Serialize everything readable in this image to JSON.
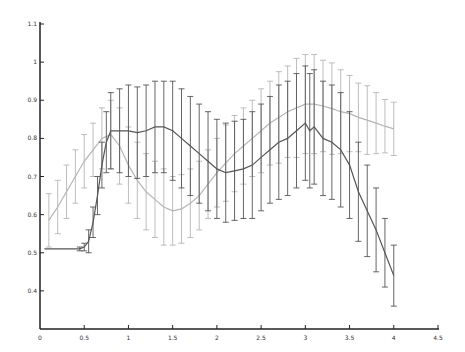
{
  "chart_data": {
    "type": "line",
    "title": "",
    "xlabel": "",
    "ylabel": "",
    "xlim": [
      0,
      4.5
    ],
    "ylim": [
      0.3,
      1.1
    ],
    "x_ticks": [
      0,
      0.5,
      1,
      1.5,
      2,
      2.5,
      3,
      3.5,
      4,
      4.5
    ],
    "x_tick_labels": [
      "0",
      "0.5",
      "1",
      "1.5",
      "2",
      "2.5",
      "3",
      "3.5",
      "4",
      "4.5"
    ],
    "y_ticks": [
      0.4,
      0.5,
      0.6,
      0.7,
      0.8,
      0.9,
      1.0,
      1.1
    ],
    "y_tick_labels": [
      "0.4",
      "0.5",
      "0.6",
      "0.7",
      "0.8",
      "0.9",
      "1",
      "1.1"
    ],
    "grid": false,
    "legend": null,
    "error_bars": true,
    "series": [
      {
        "name": "light series",
        "color": "#b5b5b5",
        "x": [
          0.1,
          0.2,
          0.3,
          0.4,
          0.5,
          0.6,
          0.7,
          0.8,
          0.9,
          1.0,
          1.1,
          1.2,
          1.3,
          1.4,
          1.5,
          1.6,
          1.7,
          1.8,
          1.9,
          2.0,
          2.1,
          2.2,
          2.3,
          2.4,
          2.5,
          2.6,
          2.7,
          2.8,
          2.9,
          3.0,
          3.1,
          3.2,
          3.3,
          3.4,
          3.5,
          3.6,
          3.7,
          3.8,
          3.9,
          4.0
        ],
        "y": [
          0.585,
          0.62,
          0.66,
          0.7,
          0.74,
          0.77,
          0.8,
          0.81,
          0.78,
          0.73,
          0.69,
          0.66,
          0.64,
          0.62,
          0.61,
          0.615,
          0.63,
          0.65,
          0.68,
          0.71,
          0.735,
          0.76,
          0.78,
          0.8,
          0.82,
          0.84,
          0.855,
          0.87,
          0.88,
          0.89,
          0.89,
          0.885,
          0.878,
          0.87,
          0.865,
          0.855,
          0.848,
          0.84,
          0.832,
          0.825
        ],
        "err": [
          0.07,
          0.07,
          0.07,
          0.07,
          0.07,
          0.07,
          0.08,
          0.09,
          0.1,
          0.1,
          0.1,
          0.1,
          0.1,
          0.1,
          0.09,
          0.09,
          0.09,
          0.09,
          0.09,
          0.09,
          0.1,
          0.1,
          0.1,
          0.1,
          0.11,
          0.11,
          0.12,
          0.12,
          0.13,
          0.13,
          0.13,
          0.12,
          0.12,
          0.11,
          0.1,
          0.09,
          0.09,
          0.08,
          0.07,
          0.07
        ]
      },
      {
        "name": "dark series",
        "color": "#555555",
        "x": [
          0.05,
          0.15,
          0.25,
          0.35,
          0.45,
          0.5,
          0.55,
          0.6,
          0.65,
          0.7,
          0.75,
          0.8,
          0.9,
          1.0,
          1.1,
          1.2,
          1.3,
          1.4,
          1.5,
          1.6,
          1.7,
          1.8,
          1.9,
          2.0,
          2.1,
          2.2,
          2.3,
          2.4,
          2.5,
          2.6,
          2.7,
          2.8,
          2.9,
          3.0,
          3.05,
          3.1,
          3.2,
          3.3,
          3.4,
          3.5,
          3.6,
          3.7,
          3.8,
          3.9,
          4.0
        ],
        "y": [
          0.51,
          0.51,
          0.51,
          0.51,
          0.51,
          0.515,
          0.53,
          0.58,
          0.65,
          0.73,
          0.79,
          0.82,
          0.82,
          0.82,
          0.815,
          0.82,
          0.83,
          0.83,
          0.82,
          0.8,
          0.78,
          0.76,
          0.74,
          0.72,
          0.71,
          0.715,
          0.72,
          0.73,
          0.75,
          0.77,
          0.79,
          0.8,
          0.82,
          0.84,
          0.82,
          0.83,
          0.8,
          0.79,
          0.77,
          0.73,
          0.66,
          0.61,
          0.56,
          0.5,
          0.44
        ],
        "err": [
          0.0,
          0.0,
          0.0,
          0.0,
          0.005,
          0.01,
          0.03,
          0.04,
          0.05,
          0.06,
          0.08,
          0.1,
          0.11,
          0.12,
          0.12,
          0.12,
          0.12,
          0.12,
          0.13,
          0.13,
          0.13,
          0.13,
          0.13,
          0.13,
          0.13,
          0.13,
          0.13,
          0.14,
          0.14,
          0.14,
          0.15,
          0.15,
          0.15,
          0.15,
          0.15,
          0.15,
          0.15,
          0.15,
          0.15,
          0.14,
          0.13,
          0.12,
          0.11,
          0.09,
          0.08
        ]
      }
    ]
  }
}
